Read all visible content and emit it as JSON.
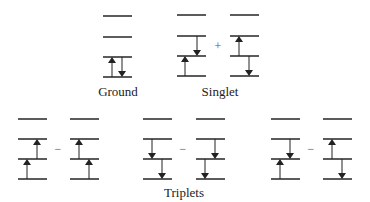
{
  "colors": {
    "line": "#333333",
    "arrow": "#222222",
    "text": "#222222",
    "background": "#ffffff"
  },
  "labels": {
    "ground": "Ground",
    "singlet": "Singlet",
    "triplets": "Triplets"
  },
  "operators": {
    "singlet": "+",
    "triplet1": "−",
    "triplet2": "−",
    "triplet3": "−"
  },
  "level_count": 4,
  "groups": [
    {
      "id": "ground",
      "x": 103,
      "levels_y": [
        16,
        37,
        57,
        77
      ],
      "arrows": [
        {
          "x": 112,
          "from_level": 3,
          "to_level": 2,
          "dir": "up"
        },
        {
          "x": 122,
          "from_level": 2,
          "to_level": 3,
          "dir": "down"
        }
      ]
    },
    {
      "id": "singlet-a",
      "x": 177,
      "levels_y": [
        15,
        36,
        56,
        76
      ],
      "arrows": [
        {
          "x": 185,
          "from_level": 3,
          "to_level": 2,
          "dir": "up"
        },
        {
          "x": 197,
          "from_level": 1,
          "to_level": 2,
          "dir": "down"
        }
      ]
    },
    {
      "id": "singlet-b",
      "x": 230,
      "levels_y": [
        15,
        36,
        56,
        76
      ],
      "arrows": [
        {
          "x": 239,
          "from_level": 2,
          "to_level": 1,
          "dir": "up"
        },
        {
          "x": 249,
          "from_level": 2,
          "to_level": 3,
          "dir": "down"
        }
      ]
    },
    {
      "id": "triplet1-a",
      "x": 18,
      "levels_y": [
        119,
        139,
        159,
        179
      ],
      "arrows": [
        {
          "x": 27,
          "from_level": 3,
          "to_level": 2,
          "dir": "up"
        },
        {
          "x": 37,
          "from_level": 2,
          "to_level": 1,
          "dir": "up"
        }
      ]
    },
    {
      "id": "triplet1-b",
      "x": 70,
      "levels_y": [
        119,
        139,
        159,
        179
      ],
      "arrows": [
        {
          "x": 79,
          "from_level": 2,
          "to_level": 1,
          "dir": "up"
        },
        {
          "x": 89,
          "from_level": 3,
          "to_level": 2,
          "dir": "up"
        }
      ]
    },
    {
      "id": "triplet2-a",
      "x": 143,
      "levels_y": [
        119,
        139,
        159,
        179
      ],
      "arrows": [
        {
          "x": 152,
          "from_level": 1,
          "to_level": 2,
          "dir": "down"
        },
        {
          "x": 162,
          "from_level": 2,
          "to_level": 3,
          "dir": "down"
        }
      ]
    },
    {
      "id": "triplet2-b",
      "x": 196,
      "levels_y": [
        119,
        139,
        159,
        179
      ],
      "arrows": [
        {
          "x": 205,
          "from_level": 2,
          "to_level": 3,
          "dir": "down"
        },
        {
          "x": 215,
          "from_level": 1,
          "to_level": 2,
          "dir": "down"
        }
      ]
    },
    {
      "id": "triplet3-a",
      "x": 271,
      "levels_y": [
        119,
        139,
        159,
        179
      ],
      "arrows": [
        {
          "x": 280,
          "from_level": 3,
          "to_level": 2,
          "dir": "up"
        },
        {
          "x": 290,
          "from_level": 1,
          "to_level": 2,
          "dir": "down"
        }
      ]
    },
    {
      "id": "triplet3-b",
      "x": 323,
      "levels_y": [
        119,
        139,
        159,
        179
      ],
      "arrows": [
        {
          "x": 332,
          "from_level": 2,
          "to_level": 1,
          "dir": "up"
        },
        {
          "x": 342,
          "from_level": 2,
          "to_level": 3,
          "dir": "down"
        }
      ]
    }
  ],
  "level_width": 29
}
